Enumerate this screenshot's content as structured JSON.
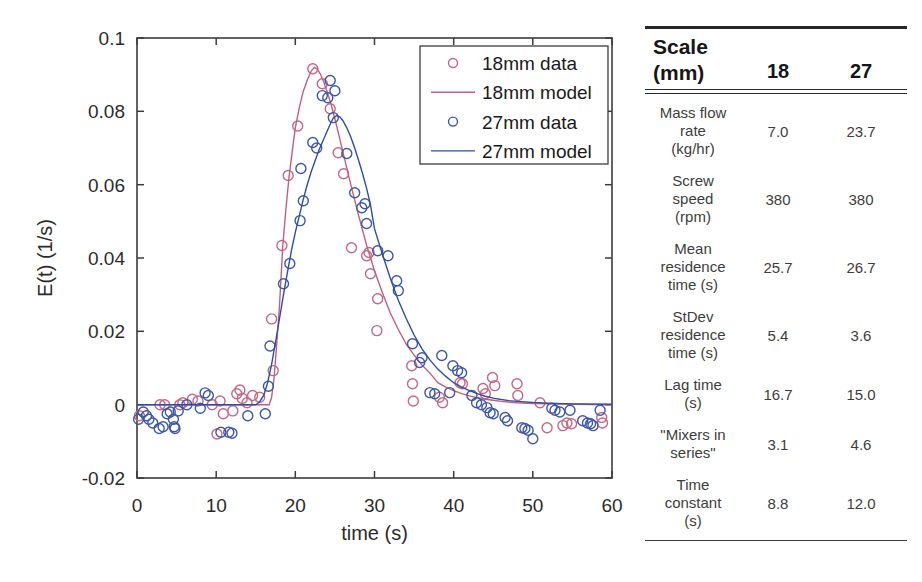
{
  "chart_data": {
    "type": "scatter",
    "title": "",
    "xlabel": "time (s)",
    "ylabel": "E(t) (1/s)",
    "xlim": [
      0,
      60
    ],
    "ylim": [
      -0.02,
      0.1
    ],
    "xticks": [
      {
        "v": 0,
        "label": "0"
      },
      {
        "v": 10,
        "label": "10"
      },
      {
        "v": 20,
        "label": "20"
      },
      {
        "v": 30,
        "label": "30"
      },
      {
        "v": 40,
        "label": "40"
      },
      {
        "v": 50,
        "label": "50"
      },
      {
        "v": 60,
        "label": "60"
      }
    ],
    "yticks": [
      {
        "v": -0.02,
        "label": "-0.02"
      },
      {
        "v": 0,
        "label": "0"
      },
      {
        "v": 0.02,
        "label": "0.02"
      },
      {
        "v": 0.04,
        "label": "0.04"
      },
      {
        "v": 0.06,
        "label": "0.06"
      },
      {
        "v": 0.08,
        "label": "0.08"
      },
      {
        "v": 0.1,
        "label": "0.1"
      }
    ],
    "grid": false,
    "legend_position": "inside-top-right",
    "series": [
      {
        "name": "18mm data",
        "kind": "scatter",
        "color": "#c46884",
        "points": [
          [
            0.3,
            -0.003
          ],
          [
            2.9,
            0
          ],
          [
            3.5,
            0
          ],
          [
            5.4,
            0
          ],
          [
            5.8,
            0.0005
          ],
          [
            7.0,
            0.0015
          ],
          [
            7.7,
            0.001
          ],
          [
            9.5,
            0
          ],
          [
            10.1,
            -0.008
          ],
          [
            10.5,
            0.001
          ],
          [
            10.9,
            -0.0025
          ],
          [
            12.1,
            -0.0017
          ],
          [
            12.6,
            0.003
          ],
          [
            13.0,
            0.004
          ],
          [
            13.3,
            0.0017
          ],
          [
            13.9,
            0.0005
          ],
          [
            14.6,
            0.0025
          ],
          [
            15.5,
            0.002
          ],
          [
            17.0,
            0.0234
          ],
          [
            17.2,
            0.0093
          ],
          [
            18.3,
            0.0434
          ],
          [
            19.1,
            0.0625
          ],
          [
            20.3,
            0.076
          ],
          [
            22.2,
            0.0916
          ],
          [
            23.4,
            0.0875
          ],
          [
            24.4,
            0.0807
          ],
          [
            25.4,
            0.0687
          ],
          [
            26.1,
            0.063
          ],
          [
            27.1,
            0.0428
          ],
          [
            29.0,
            0.0406
          ],
          [
            29.3,
            0.0415
          ],
          [
            29.5,
            0.0357
          ],
          [
            30.3,
            0.0202
          ],
          [
            30.4,
            0.0289
          ],
          [
            34.7,
            0.0106
          ],
          [
            34.8,
            0.0057
          ],
          [
            34.9,
            0.001
          ],
          [
            38.2,
            0.002
          ],
          [
            38.6,
            0.0005
          ],
          [
            40.8,
            0.006
          ],
          [
            41.1,
            0.0057
          ],
          [
            43.7,
            0.0044
          ],
          [
            44.0,
            0.003
          ],
          [
            44.9,
            0.0074
          ],
          [
            45.2,
            0.0052
          ],
          [
            48.0,
            0.0057
          ],
          [
            48.1,
            0.0025
          ],
          [
            50.9,
            0.0005
          ],
          [
            51.8,
            -0.0063
          ],
          [
            53.8,
            -0.0057
          ],
          [
            54.3,
            -0.005
          ],
          [
            54.9,
            -0.0052
          ],
          [
            58.7,
            -0.0035
          ],
          [
            58.8,
            -0.005
          ]
        ]
      },
      {
        "name": "18mm model",
        "kind": "line",
        "color": "#c25f7e",
        "points": [
          [
            0,
            0
          ],
          [
            16.7,
            0
          ],
          [
            17,
            0.002
          ],
          [
            17.3,
            0.007
          ],
          [
            17.6,
            0.015
          ],
          [
            18,
            0.027
          ],
          [
            18.4,
            0.043
          ],
          [
            18.8,
            0.053
          ],
          [
            19.2,
            0.062
          ],
          [
            19.6,
            0.069
          ],
          [
            20,
            0.0755
          ],
          [
            20.5,
            0.081
          ],
          [
            21,
            0.0855
          ],
          [
            21.5,
            0.0885
          ],
          [
            22,
            0.091
          ],
          [
            22.4,
            0.092
          ],
          [
            22.8,
            0.0915
          ],
          [
            23.2,
            0.09
          ],
          [
            23.6,
            0.088
          ],
          [
            24,
            0.0855
          ],
          [
            24.5,
            0.082
          ],
          [
            25,
            0.078
          ],
          [
            25.5,
            0.0735
          ],
          [
            26,
            0.069
          ],
          [
            27,
            0.06
          ],
          [
            28,
            0.0515
          ],
          [
            29,
            0.0435
          ],
          [
            30,
            0.0365
          ],
          [
            31,
            0.0305
          ],
          [
            32,
            0.025
          ],
          [
            33,
            0.0205
          ],
          [
            34,
            0.0165
          ],
          [
            35,
            0.0135
          ],
          [
            36,
            0.0108
          ],
          [
            37,
            0.0086
          ],
          [
            38,
            0.006
          ],
          [
            39,
            0.0048
          ],
          [
            40,
            0.0038
          ],
          [
            41,
            0.003
          ],
          [
            42,
            0.0024
          ],
          [
            43,
            0.0019
          ],
          [
            44,
            0.0015
          ],
          [
            45,
            0.0012
          ],
          [
            46,
            0.0009
          ],
          [
            48,
            0.0005
          ],
          [
            50,
            0.0003
          ],
          [
            52,
            0.0002
          ],
          [
            55,
            0.0001
          ],
          [
            60,
            0
          ]
        ]
      },
      {
        "name": "27mm data",
        "kind": "scatter",
        "color": "#3d57ab",
        "points": [
          [
            0.2,
            -0.004
          ],
          [
            0.8,
            -0.002
          ],
          [
            1.2,
            -0.003
          ],
          [
            1.5,
            -0.004
          ],
          [
            2.0,
            -0.005
          ],
          [
            2.8,
            -0.0065
          ],
          [
            3.3,
            -0.006
          ],
          [
            3.8,
            -0.0025
          ],
          [
            4.2,
            -0.002
          ],
          [
            4.6,
            -0.004
          ],
          [
            4.7,
            -0.006
          ],
          [
            4.8,
            -0.0065
          ],
          [
            5.2,
            -0.0017
          ],
          [
            6.3,
            0
          ],
          [
            8.0,
            -0.001
          ],
          [
            8.6,
            0.0032
          ],
          [
            9.0,
            0.0025
          ],
          [
            10.6,
            -0.0075
          ],
          [
            11.6,
            -0.0075
          ],
          [
            12.0,
            -0.0078
          ],
          [
            14.0,
            -0.003
          ],
          [
            16.2,
            -0.0025
          ],
          [
            16.6,
            0.005
          ],
          [
            16.8,
            0.016
          ],
          [
            18.5,
            0.033
          ],
          [
            19.3,
            0.0385
          ],
          [
            20.6,
            0.0502
          ],
          [
            20.7,
            0.0644
          ],
          [
            21.0,
            0.0556
          ],
          [
            22.2,
            0.0715
          ],
          [
            22.7,
            0.07
          ],
          [
            23.4,
            0.0843
          ],
          [
            24.1,
            0.0837
          ],
          [
            24.4,
            0.0884
          ],
          [
            25.0,
            0.0856
          ],
          [
            24.8,
            0.0783
          ],
          [
            26.5,
            0.0685
          ],
          [
            27.5,
            0.0578
          ],
          [
            28.4,
            0.0537
          ],
          [
            28.8,
            0.0548
          ],
          [
            29.0,
            0.0494
          ],
          [
            30.4,
            0.042
          ],
          [
            31.7,
            0.0406
          ],
          [
            32.8,
            0.0338
          ],
          [
            33.0,
            0.0311
          ],
          [
            34.8,
            0.0166
          ],
          [
            35.7,
            0.0115
          ],
          [
            36.0,
            0.0128
          ],
          [
            37.0,
            0.0033
          ],
          [
            37.6,
            0.003
          ],
          [
            38.5,
            0.0134
          ],
          [
            39.5,
            0.0033
          ],
          [
            39.9,
            0.0106
          ],
          [
            40.5,
            0.0093
          ],
          [
            41.0,
            0.0087
          ],
          [
            42.3,
            0.0025
          ],
          [
            42.9,
            0.0005
          ],
          [
            43.5,
            0
          ],
          [
            44.2,
            -0.0008
          ],
          [
            44.6,
            -0.0022
          ],
          [
            45.0,
            -0.0025
          ],
          [
            46.5,
            -0.0035
          ],
          [
            46.8,
            -0.0044
          ],
          [
            48.6,
            -0.0063
          ],
          [
            49.0,
            -0.0065
          ],
          [
            49.4,
            -0.007
          ],
          [
            50.0,
            -0.0093
          ],
          [
            52.4,
            -0.001
          ],
          [
            52.8,
            -0.0015
          ],
          [
            53.4,
            -0.002
          ],
          [
            54.7,
            -0.0015
          ],
          [
            56.3,
            -0.0044
          ],
          [
            56.9,
            -0.005
          ],
          [
            57.3,
            -0.0052
          ],
          [
            57.6,
            -0.0057
          ],
          [
            58.5,
            -0.0015
          ]
        ]
      },
      {
        "name": "27mm model",
        "kind": "line",
        "color": "#2e4da6",
        "points": [
          [
            0,
            0
          ],
          [
            15.0,
            0
          ],
          [
            15.5,
            0.0008
          ],
          [
            16,
            0.0025
          ],
          [
            16.5,
            0.006
          ],
          [
            17,
            0.011
          ],
          [
            17.5,
            0.017
          ],
          [
            18,
            0.0235
          ],
          [
            18.5,
            0.03
          ],
          [
            19,
            0.036
          ],
          [
            19.5,
            0.042
          ],
          [
            20,
            0.047
          ],
          [
            20.5,
            0.0515
          ],
          [
            21,
            0.056
          ],
          [
            21.5,
            0.06
          ],
          [
            22,
            0.0635
          ],
          [
            22.5,
            0.0665
          ],
          [
            23,
            0.0695
          ],
          [
            23.5,
            0.072
          ],
          [
            24,
            0.0745
          ],
          [
            24.4,
            0.0765
          ],
          [
            24.8,
            0.0782
          ],
          [
            25.2,
            0.0788
          ],
          [
            25.6,
            0.0785
          ],
          [
            26,
            0.0775
          ],
          [
            26.5,
            0.0755
          ],
          [
            27,
            0.073
          ],
          [
            27.5,
            0.07
          ],
          [
            28,
            0.0665
          ],
          [
            28.5,
            0.063
          ],
          [
            29,
            0.059
          ],
          [
            29.5,
            0.0545
          ],
          [
            30,
            0.048
          ],
          [
            31,
            0.041
          ],
          [
            32,
            0.0345
          ],
          [
            33,
            0.0285
          ],
          [
            34,
            0.0235
          ],
          [
            35,
            0.019
          ],
          [
            36,
            0.0152
          ],
          [
            37,
            0.0122
          ],
          [
            38,
            0.0097
          ],
          [
            39,
            0.0077
          ],
          [
            40,
            0.006
          ],
          [
            41,
            0.0048
          ],
          [
            42,
            0.0038
          ],
          [
            43,
            0.003
          ],
          [
            44,
            0.0023
          ],
          [
            45,
            0.0018
          ],
          [
            46,
            0.0014
          ],
          [
            47,
            0.0011
          ],
          [
            48,
            0.0009
          ],
          [
            50,
            0.0006
          ],
          [
            52,
            0.0004
          ],
          [
            55,
            0.0002
          ],
          [
            60,
            0.0001
          ]
        ]
      }
    ],
    "legend": [
      "18mm data",
      "18mm model",
      "27mm data",
      "27mm model"
    ]
  },
  "table": {
    "header": {
      "title": "Scale",
      "unit": "(mm)",
      "col1": "18",
      "col2": "27"
    },
    "rows": [
      {
        "label": "Mass flow\nrate\n(kg/hr)",
        "v18": "7.0",
        "v27": "23.7"
      },
      {
        "label": "Screw\nspeed\n(rpm)",
        "v18": "380",
        "v27": "380"
      },
      {
        "label": "Mean\nresidence\ntime (s)",
        "v18": "25.7",
        "v27": "26.7"
      },
      {
        "label": "StDev\nresidence\ntime (s)",
        "v18": "5.4",
        "v27": "3.6"
      },
      {
        "label": "Lag time\n(s)",
        "v18": "16.7",
        "v27": "15.0"
      },
      {
        "label": "\"Mixers in\nseries\"",
        "v18": "3.1",
        "v27": "4.6"
      },
      {
        "label": "Time\nconstant\n(s)",
        "v18": "8.8",
        "v27": "12.0"
      }
    ]
  },
  "colors": {
    "pink_marker": "#c46884",
    "pink_line": "#c25f7e",
    "blue_marker": "#3d57ab",
    "blue_line": "#2e4da6",
    "axis": "#3c3c3c",
    "text": "#2b2b2b"
  }
}
